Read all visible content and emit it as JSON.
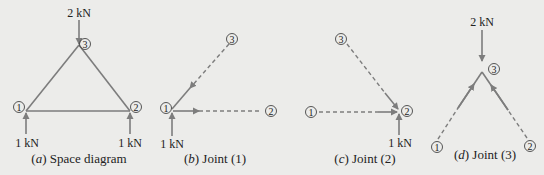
{
  "figure": {
    "colors": {
      "background": "#ececea",
      "member": "#7d7d7d",
      "text": "#222222"
    },
    "panels": [
      {
        "id": "a",
        "caption_letter": "a",
        "caption_text": "Space diagram",
        "loads": {
          "top": "2 kN",
          "left": "1 kN",
          "right": "1 kN"
        },
        "nodes": [
          "1",
          "2",
          "3"
        ]
      },
      {
        "id": "b",
        "caption_letter": "b",
        "caption_text": "Joint (1)",
        "loads": {
          "bottom": "1 kN"
        },
        "nodes": [
          "1",
          "2",
          "3"
        ]
      },
      {
        "id": "c",
        "caption_letter": "c",
        "caption_text": "Joint (2)",
        "loads": {
          "bottom": "1 kN"
        },
        "nodes": [
          "1",
          "2",
          "3"
        ]
      },
      {
        "id": "d",
        "caption_letter": "d",
        "caption_text": "Joint (3)",
        "loads": {
          "top": "2 kN"
        },
        "nodes": [
          "1",
          "2",
          "3"
        ]
      }
    ]
  }
}
